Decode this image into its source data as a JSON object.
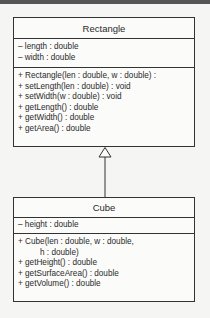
{
  "diagram": {
    "type": "UML class diagram",
    "relationship": "generalization",
    "classes": [
      {
        "name": "Rectangle",
        "attributes": [
          "– length : double",
          "– width : double"
        ],
        "operations": [
          "+ Rectangle(len : double, w : double) :",
          "+ setLength(len : double) : void",
          "+ setWidth(w : double) : void",
          "+ getLength() : double",
          "+ getWidth() : double",
          "+ getArea() : double"
        ]
      },
      {
        "name": "Cube",
        "attributes": [
          "– height : double"
        ],
        "operations": [
          "+ Cube(len : double, w : double,",
          "h : double)",
          "+ getHeight() : double",
          "+ getSurfaceArea() : double",
          "+ getVolume() : double"
        ]
      }
    ],
    "edges": [
      {
        "from": "Cube",
        "to": "Rectangle",
        "kind": "inheritance",
        "arrow": "hollow-triangle"
      }
    ]
  }
}
